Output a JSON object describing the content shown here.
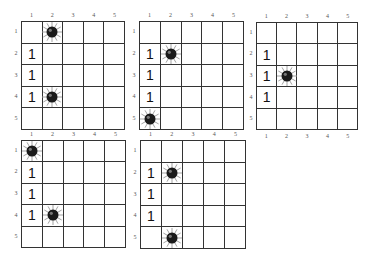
{
  "boards": [
    {
      "id": "board-1",
      "col_labels": [
        "1",
        "2",
        "3",
        "4",
        "5"
      ],
      "row_labels": [
        "1",
        "2",
        "3",
        "4",
        "5"
      ],
      "bottom_labels": false,
      "cells": [
        [
          "",
          "mine",
          "",
          "",
          ""
        ],
        [
          "1",
          "",
          "",
          "",
          ""
        ],
        [
          "1",
          "",
          "",
          "",
          ""
        ],
        [
          "1",
          "mine",
          "",
          "",
          ""
        ],
        [
          "",
          "",
          "",
          "",
          ""
        ]
      ]
    },
    {
      "id": "board-2",
      "col_labels": [
        "1",
        "2",
        "3",
        "4",
        "5"
      ],
      "row_labels": [
        "1",
        "2",
        "3",
        "4",
        "5"
      ],
      "bottom_labels": false,
      "cells": [
        [
          "",
          "",
          "",
          "",
          ""
        ],
        [
          "1",
          "mine",
          "",
          "",
          ""
        ],
        [
          "1",
          "",
          "",
          "",
          ""
        ],
        [
          "1",
          "",
          "",
          "",
          ""
        ],
        [
          "mine",
          "",
          "",
          "",
          ""
        ]
      ]
    },
    {
      "id": "board-3",
      "col_labels": [
        "1",
        "2",
        "3",
        "4",
        "5"
      ],
      "row_labels": [
        "1",
        "2",
        "3",
        "4",
        "5"
      ],
      "bottom_labels": true,
      "cells": [
        [
          "",
          "",
          "",
          "",
          ""
        ],
        [
          "1",
          "",
          "",
          "",
          ""
        ],
        [
          "1",
          "mine",
          "",
          "",
          ""
        ],
        [
          "1",
          "",
          "",
          "",
          ""
        ],
        [
          "",
          "",
          "",
          "",
          ""
        ]
      ]
    },
    {
      "id": "board-4",
      "col_labels": [
        "1",
        "2",
        "3",
        "4",
        "5"
      ],
      "row_labels": [
        "1",
        "2",
        "3",
        "4",
        "5"
      ],
      "bottom_labels": false,
      "cells": [
        [
          "mine",
          "",
          "",
          "",
          ""
        ],
        [
          "1",
          "",
          "",
          "",
          ""
        ],
        [
          "1",
          "",
          "",
          "",
          ""
        ],
        [
          "1",
          "mine",
          "",
          "",
          ""
        ],
        [
          "",
          "",
          "",
          "",
          ""
        ]
      ]
    },
    {
      "id": "board-5",
      "col_labels": [
        "1",
        "2",
        "3",
        "4",
        "5"
      ],
      "row_labels": [
        "1",
        "2",
        "3",
        "4",
        "5"
      ],
      "bottom_labels": false,
      "cells": [
        [
          "",
          "",
          "",
          "",
          ""
        ],
        [
          "1",
          "mine",
          "",
          "",
          ""
        ],
        [
          "1",
          "",
          "",
          "",
          ""
        ],
        [
          "1",
          "",
          "",
          "",
          ""
        ],
        [
          "",
          "mine",
          "",
          "",
          ""
        ]
      ]
    }
  ],
  "icons": {
    "mine": "mine-icon"
  },
  "colors": {
    "grid_line": "#333333",
    "mine_body": "#1a1a1a",
    "mine_spike": "#999999",
    "number": "#111111"
  }
}
